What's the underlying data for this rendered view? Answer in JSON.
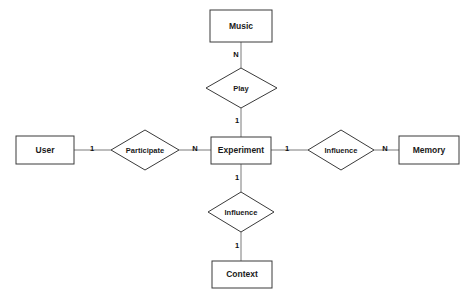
{
  "diagram": {
    "type": "entity-relationship-diagram",
    "background_color": "#ffffff",
    "entity_stroke_color": "#3a3a3a",
    "connector_color": "#7a7a7a",
    "text_color": "#1a1a1a",
    "entities": [
      {
        "id": "music",
        "label": "Music",
        "x": 241,
        "y": 26,
        "w": 62,
        "h": 32
      },
      {
        "id": "user",
        "label": "User",
        "x": 45,
        "y": 150,
        "w": 58,
        "h": 28
      },
      {
        "id": "experiment",
        "label": "Experiment",
        "x": 241,
        "y": 150,
        "w": 60,
        "h": 27
      },
      {
        "id": "memory",
        "label": "Memory",
        "x": 429,
        "y": 150,
        "w": 60,
        "h": 28
      },
      {
        "id": "context",
        "label": "Context",
        "x": 242,
        "y": 274,
        "w": 60,
        "h": 27
      }
    ],
    "relationships": [
      {
        "id": "play",
        "label": "Play",
        "x": 241,
        "y": 88,
        "rx": 35,
        "ry": 20
      },
      {
        "id": "participate",
        "label": "Participate",
        "x": 145,
        "y": 150,
        "rx": 34,
        "ry": 20
      },
      {
        "id": "influence-memory",
        "label": "Influence",
        "x": 341,
        "y": 150,
        "rx": 33,
        "ry": 20
      },
      {
        "id": "influence-context",
        "label": "Influence",
        "x": 241,
        "y": 212,
        "rx": 33,
        "ry": 20
      }
    ],
    "connectors": [
      {
        "id": "music-play",
        "from": "music",
        "to": "play",
        "x1": 241,
        "y1": 42,
        "x2": 241,
        "y2": 68
      },
      {
        "id": "play-experiment",
        "from": "play",
        "to": "experiment",
        "x1": 241,
        "y1": 108,
        "x2": 241,
        "y2": 137
      },
      {
        "id": "user-participate",
        "from": "user",
        "to": "participate",
        "x1": 74,
        "y1": 150,
        "x2": 111,
        "y2": 150
      },
      {
        "id": "participate-experiment",
        "from": "participate",
        "to": "experiment",
        "x1": 179,
        "y1": 150,
        "x2": 211,
        "y2": 150
      },
      {
        "id": "experiment-influence-memory",
        "from": "experiment",
        "to": "influence-memory",
        "x1": 271,
        "y1": 150,
        "x2": 308,
        "y2": 150
      },
      {
        "id": "influence-memory-memory",
        "from": "influence-memory",
        "to": "memory",
        "x1": 374,
        "y1": 150,
        "x2": 399,
        "y2": 150
      },
      {
        "id": "experiment-influence-context",
        "from": "experiment",
        "to": "influence-context",
        "x1": 241,
        "y1": 164,
        "x2": 241,
        "y2": 192
      },
      {
        "id": "influence-context-context",
        "from": "influence-context",
        "to": "context",
        "x1": 241,
        "y1": 232,
        "x2": 241,
        "y2": 261
      }
    ],
    "cardinalities": [
      {
        "id": "music-play-card",
        "value": "N",
        "x": 236,
        "y": 55
      },
      {
        "id": "play-experiment-card",
        "value": "1",
        "x": 237,
        "y": 121
      },
      {
        "id": "user-participate-card",
        "value": "1",
        "x": 92,
        "y": 149
      },
      {
        "id": "participate-experiment-card",
        "value": "N",
        "x": 195,
        "y": 149
      },
      {
        "id": "experiment-influence-card",
        "value": "1",
        "x": 287,
        "y": 149
      },
      {
        "id": "influence-memory-card",
        "value": "N",
        "x": 385,
        "y": 149
      },
      {
        "id": "experiment-context-card",
        "value": "1",
        "x": 237,
        "y": 178
      },
      {
        "id": "influence-context-card",
        "value": "1",
        "x": 237,
        "y": 246
      }
    ]
  }
}
